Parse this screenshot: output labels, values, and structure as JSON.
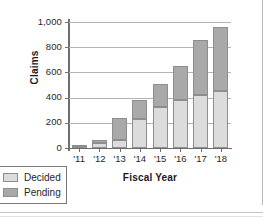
{
  "chart_data": {
    "type": "bar",
    "subtype": "stacked-vertical",
    "title": "",
    "xlabel": "Fiscal Year",
    "ylabel": "Claims",
    "categories": [
      "'11",
      "'12",
      "'13",
      "'14",
      "'15",
      "'16",
      "'17",
      "'18"
    ],
    "series": [
      {
        "name": "Decided",
        "color": "#dcdcdc",
        "values": [
          8,
          38,
          65,
          232,
          325,
          378,
          420,
          455
        ]
      },
      {
        "name": "Pending",
        "color": "#a9a9a9",
        "values": [
          2,
          27,
          170,
          153,
          182,
          272,
          435,
          505
        ]
      }
    ],
    "totals": [
      10,
      65,
      235,
      385,
      507,
      650,
      855,
      960
    ],
    "ylim": [
      0,
      1000
    ],
    "yticks": [
      0,
      200,
      400,
      600,
      800,
      1000
    ],
    "ytick_labels": [
      "0",
      "200",
      "400",
      "600",
      "800",
      "1,000"
    ],
    "grid": true,
    "grid_axis": "y",
    "legend_position": "bottom-left"
  },
  "legend": {
    "items": [
      {
        "label": "Decided",
        "color": "#dcdcdc"
      },
      {
        "label": "Pending",
        "color": "#a9a9a9"
      }
    ]
  },
  "axis": {
    "y_title": "Claims",
    "x_title": "Fiscal Year"
  }
}
